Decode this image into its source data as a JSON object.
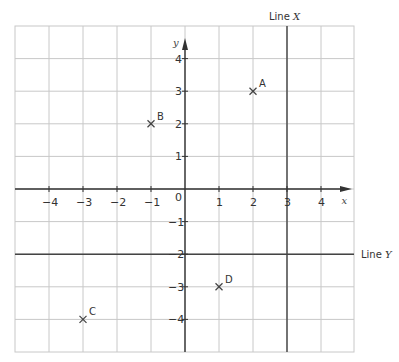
{
  "diagram": {
    "type": "coordinate-grid",
    "x_axis": {
      "label": "x",
      "min": -5,
      "max": 5,
      "ticks": [
        -4,
        -3,
        -2,
        -1,
        1,
        2,
        3,
        4
      ]
    },
    "y_axis": {
      "label": "y",
      "min": -5,
      "max": 5,
      "ticks": [
        4,
        3,
        2,
        1,
        -1,
        -2,
        -3,
        -4
      ]
    },
    "origin_label": "0",
    "points": [
      {
        "label": "A",
        "x": 2,
        "y": 3
      },
      {
        "label": "B",
        "x": -1,
        "y": 2
      },
      {
        "label": "C",
        "x": -3,
        "y": -4
      },
      {
        "label": "D",
        "x": 1,
        "y": -3
      }
    ],
    "lines": [
      {
        "label": "Line X",
        "name": "Line",
        "var": "X",
        "equation": "x = 3"
      },
      {
        "label": "Line Y",
        "name": "Line",
        "var": "Y",
        "equation": "y = -2"
      }
    ],
    "colors": {
      "grid": "#c8c8c8",
      "axis": "#333333",
      "line": "#444444",
      "marker": "#444444"
    }
  }
}
